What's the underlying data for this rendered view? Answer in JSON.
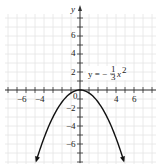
{
  "chart_data": {
    "type": "line",
    "title": "",
    "xlabel": "",
    "ylabel": "y",
    "xlim": [
      -8,
      8
    ],
    "ylim": [
      -8,
      8
    ],
    "grid": true,
    "x_tick_labels": [
      "-6",
      "-4",
      "4",
      "6"
    ],
    "y_tick_labels": [
      "6",
      "4",
      "2",
      "-2",
      "-4",
      "-6"
    ],
    "origin_label": "0",
    "series": [
      {
        "name": "y = -1/3 x^2",
        "equation": "y = -(1/3)x^2",
        "x": [
          -5,
          -4,
          -3,
          -2,
          -1,
          0,
          1,
          2,
          3,
          4,
          5
        ],
        "values": [
          -8.33,
          -5.33,
          -3,
          -1.33,
          -0.33,
          0,
          -0.33,
          -1.33,
          -3,
          -5.33,
          -8.33
        ]
      }
    ],
    "annotations": [
      {
        "text": "y = -1/3 x^2",
        "x": 1.5,
        "y": 2
      }
    ]
  },
  "labels": {
    "y_axis": "y",
    "origin": "0",
    "eq_prefix": "y = −",
    "eq_num": "1",
    "eq_den": "3",
    "eq_var": "x",
    "eq_exp": "2",
    "x_ticks": {
      "n6": "−6",
      "n4": "−4",
      "p4": "4",
      "p6": "6"
    },
    "y_ticks": {
      "p6": "6",
      "p4": "4",
      "p2": "2",
      "n2": "−2",
      "n4": "−4",
      "n6": "−6"
    }
  },
  "colors": {
    "grid": "#e4e4e4",
    "axis": "#333333",
    "curve": "#111111"
  }
}
